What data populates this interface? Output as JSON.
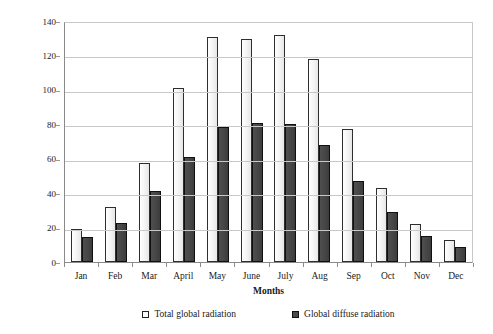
{
  "chart_data": {
    "type": "bar",
    "title": "",
    "xlabel": "Months",
    "ylabel": "Radiation, kWh/m²",
    "ylabel_main": "Radiation, kWh/m",
    "ylabel_sup": "2",
    "ylim": [
      0,
      140
    ],
    "yticks": [
      0,
      20,
      40,
      60,
      80,
      100,
      120,
      140
    ],
    "grid": true,
    "legend_position": "bottom",
    "categories": [
      "Jan",
      "Feb",
      "Mar",
      "April",
      "May",
      "June",
      "July",
      "Aug",
      "Sep",
      "Oct",
      "Nov",
      "Dec"
    ],
    "series": [
      {
        "name": "Total global radiation",
        "color": "#f2f2f2",
        "values": [
          19,
          32,
          57.5,
          101,
          131,
          129.5,
          132,
          118,
          77,
          43,
          22,
          13
        ]
      },
      {
        "name": "Global diffuse radiation",
        "color": "#4a4a4a",
        "values": [
          14.5,
          22.5,
          41,
          61,
          78.5,
          80.5,
          80,
          68,
          47,
          29,
          15,
          9
        ]
      }
    ]
  },
  "axes": {
    "y_title": "Radiation, kWh/m",
    "y_title_superscript": "2",
    "x_title": "Months"
  },
  "legend": {
    "items": [
      {
        "label": "Total global radiation",
        "swatch": "open-square-marker"
      },
      {
        "label": "Global diffuse radiation",
        "swatch": "filled-square-marker"
      }
    ]
  },
  "colors": {
    "bar_total_fill": "#f2f2f2",
    "bar_total_border": "#2e2e2e",
    "bar_diffuse_fill": "#4a4a4a",
    "bar_diffuse_border": "#101010",
    "gridline": "#c8c8c8",
    "axis": "#8a8a8a",
    "text": "#1a1a1a",
    "background": "#ffffff"
  }
}
